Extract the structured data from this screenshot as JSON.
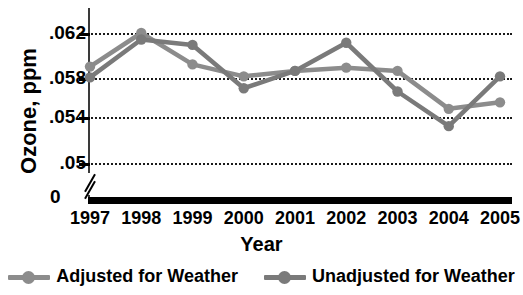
{
  "chart_data": {
    "type": "line",
    "title": "",
    "xlabel": "Year",
    "ylabel": "Ozone, ppm",
    "categories": [
      "1997",
      "1998",
      "1999",
      "2000",
      "2001",
      "2002",
      "2003",
      "2004",
      "2005"
    ],
    "x": [
      1997,
      1998,
      1999,
      2000,
      2001,
      2002,
      2003,
      2004,
      2005
    ],
    "series": [
      {
        "name": "Adjusted for Weather",
        "color": "#8c8c8c",
        "values": [
          0.0589,
          0.062,
          0.0591,
          0.058,
          0.0585,
          0.0588,
          0.0585,
          0.055,
          0.0556
        ]
      },
      {
        "name": "Unadjusted for Weather",
        "color": "#7a7a7a",
        "values": [
          0.0579,
          0.0614,
          0.0609,
          0.0569,
          0.0585,
          0.0611,
          0.0566,
          0.0534,
          0.058
        ]
      }
    ],
    "ytick_labels": [
      ".062",
      ".058",
      ".054",
      ".05"
    ],
    "ytick_values": [
      0.062,
      0.058,
      0.054,
      0.05
    ],
    "ylim": [
      0.048,
      0.0635
    ],
    "zero_label": "0",
    "axis_break": true,
    "grid": true,
    "legend_position": "bottom"
  },
  "legend": {
    "items": [
      {
        "label": "Adjusted for Weather",
        "color": "#8c8c8c"
      },
      {
        "label": "Unadjusted for Weather",
        "color": "#7a7a7a"
      }
    ]
  }
}
